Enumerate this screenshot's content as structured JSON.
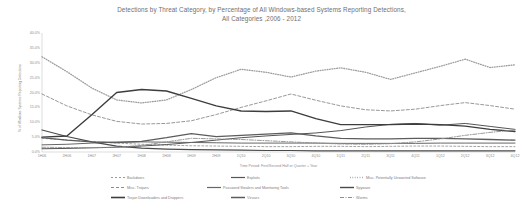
{
  "chart_data": {
    "type": "line",
    "title": "Detections by Threat Category, by Percentage of All Windows-based Systems Reporting Detections,",
    "title_line2": "All Categories ,2006 - 2012",
    "xlabel": "Time Period: First/Second Half or Quarter + Year",
    "ylabel": "% of Windows Systems Reporting Detections",
    "ylim": [
      0,
      40
    ],
    "yticks": [
      0,
      5,
      10,
      15,
      20,
      25,
      30,
      35,
      40
    ],
    "ytick_labels": [
      "0.0%",
      "5.0%",
      "10.0%",
      "15.0%",
      "20.0%",
      "25.0%",
      "30.0%",
      "35.0%",
      "40.0%"
    ],
    "grid": false,
    "legend_position": "bottom",
    "categories": [
      "1H06",
      "2H06",
      "1H07",
      "2H07",
      "1H08",
      "2H08",
      "1H09",
      "2H09",
      "1Q10",
      "2Q10",
      "3Q10",
      "4Q10",
      "1Q11",
      "2Q11",
      "3Q11",
      "4Q11",
      "1Q12",
      "2Q12",
      "3Q12",
      "4Q12"
    ],
    "series": [
      {
        "name": "Backdoors",
        "color": "#9a9a9a",
        "dash": "2,2",
        "width": 0.9,
        "values": [
          4.6,
          4.0,
          3.5,
          3.0,
          2.6,
          2.3,
          2.1,
          2.0,
          1.9,
          1.8,
          1.8,
          1.9,
          1.9,
          1.8,
          1.9,
          2.0,
          2.0,
          1.9,
          1.8,
          1.8
        ]
      },
      {
        "name": "Exploits",
        "color": "#555555",
        "dash": "",
        "width": 1.0,
        "values": [
          1.1,
          1.2,
          1.4,
          1.6,
          2.0,
          2.5,
          3.2,
          4.0,
          4.8,
          5.4,
          5.9,
          6.4,
          7.2,
          8.4,
          9.3,
          9.6,
          9.0,
          9.6,
          8.6,
          7.6
        ]
      },
      {
        "name": "Misc. Potentially Unwanted Software",
        "color": "#9e9e9e",
        "dash": "0.8,1.6",
        "width": 1.3,
        "values": [
          32.0,
          27.0,
          21.5,
          17.5,
          16.5,
          17.5,
          21.0,
          25.0,
          27.8,
          26.8,
          25.2,
          27.2,
          28.3,
          26.8,
          24.4,
          26.6,
          28.8,
          31.2,
          28.4,
          29.3
        ]
      },
      {
        "name": "Misc. Trojans",
        "color": "#8c8c8c",
        "dash": "3,2",
        "width": 0.9,
        "values": [
          19.5,
          15.5,
          12.5,
          10.3,
          9.4,
          9.6,
          10.5,
          12.6,
          15.0,
          17.2,
          19.5,
          17.4,
          15.5,
          14.2,
          13.8,
          14.4,
          15.6,
          16.6,
          15.6,
          14.4
        ]
      },
      {
        "name": "Password Stealers and Monitoring Tools",
        "color": "#666666",
        "dash": "",
        "width": 1.0,
        "values": [
          2.4,
          2.6,
          3.0,
          3.3,
          3.4,
          3.3,
          3.2,
          3.1,
          3.0,
          3.0,
          3.0,
          3.0,
          2.9,
          2.9,
          2.9,
          2.9,
          3.0,
          3.0,
          3.0,
          3.0
        ]
      },
      {
        "name": "Spyware",
        "color": "#4a4a4a",
        "dash": "",
        "width": 1.2,
        "values": [
          7.4,
          5.2,
          3.4,
          2.0,
          1.3,
          1.0,
          0.8,
          0.7,
          0.6,
          0.5,
          0.5,
          0.4,
          0.4,
          0.4,
          0.4,
          0.4,
          0.4,
          0.4,
          0.4,
          0.4
        ]
      },
      {
        "name": "Trojan Downloaders and Droppers",
        "color": "#3d3d3d",
        "dash": "",
        "width": 1.4,
        "values": [
          5.0,
          5.4,
          12.5,
          20.0,
          21.0,
          20.5,
          18.0,
          15.5,
          13.8,
          13.6,
          13.8,
          11.2,
          9.2,
          9.2,
          9.2,
          9.4,
          9.2,
          8.7,
          7.6,
          6.9
        ]
      },
      {
        "name": "Viruses",
        "color": "#5c5c5c",
        "dash": "",
        "width": 1.3,
        "values": [
          4.8,
          4.0,
          3.4,
          3.2,
          3.6,
          4.8,
          6.2,
          5.2,
          5.6,
          6.0,
          6.4,
          5.4,
          4.6,
          4.4,
          4.4,
          4.6,
          4.6,
          4.4,
          4.2,
          4.0
        ]
      },
      {
        "name": "Worms",
        "color": "#8f8f8f",
        "dash": "4,1.5,1,1.5",
        "width": 0.9,
        "values": [
          1.6,
          1.5,
          1.5,
          1.6,
          2.2,
          3.4,
          4.6,
          4.4,
          4.2,
          3.8,
          3.4,
          3.0,
          2.7,
          2.6,
          2.8,
          3.4,
          4.4,
          5.6,
          6.6,
          7.4
        ]
      }
    ]
  },
  "legend_rows": [
    [
      {
        "name": "Backdoors",
        "x": 111
      },
      {
        "name": "Exploits",
        "x": 231
      },
      {
        "name": "Misc. Potentially Unwanted Software",
        "x": 350
      }
    ],
    [
      {
        "name": "Misc. Trojans",
        "x": 111
      },
      {
        "name": "Password Stealers and Monitoring Tools",
        "x": 207
      },
      {
        "name": "Spyware",
        "x": 340
      }
    ],
    [
      {
        "name": "Trojan Downloaders and Droppers",
        "x": 111
      },
      {
        "name": "Viruses",
        "x": 231
      },
      {
        "name": "Worms",
        "x": 340
      }
    ]
  ]
}
